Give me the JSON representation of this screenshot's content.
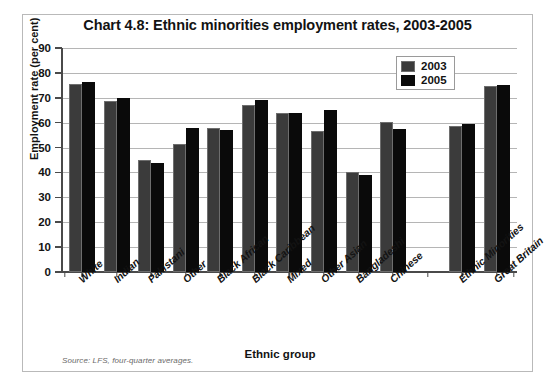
{
  "chart_data": {
    "type": "bar",
    "title": "Chart 4.8: Ethnic minorities employment rates, 2003-2005",
    "xlabel": "Ethnic group",
    "ylabel": "Employment rate (per cent)",
    "ylim": [
      0,
      90
    ],
    "ytick_step": 10,
    "yticks": [
      90,
      80,
      70,
      60,
      50,
      40,
      30,
      20,
      10,
      0
    ],
    "grid": true,
    "legend_position": "top-right",
    "categories": [
      "White",
      "Indian",
      "Pakistani",
      "Other",
      "Black African",
      "Black Caribbean",
      "Mixed",
      "Other Asian",
      "Bangladeshi",
      "Chinese",
      "",
      "Ethnic Minorities",
      "Great Britain"
    ],
    "series": [
      {
        "name": "2003",
        "color": "#3b3b3b",
        "values": [
          75.5,
          68.8,
          45.0,
          51.3,
          58.0,
          67.0,
          64.0,
          56.8,
          40.0,
          60.3,
          null,
          58.5,
          74.7
        ]
      },
      {
        "name": "2005",
        "color": "#0a0a0a",
        "values": [
          76.5,
          70.0,
          44.0,
          58.0,
          57.0,
          69.0,
          64.0,
          65.0,
          39.0,
          57.3,
          null,
          59.5,
          75.0
        ]
      }
    ],
    "source_note": "Source: LFS, four-quarter averages."
  },
  "legend": {
    "items": [
      {
        "label": "2003"
      },
      {
        "label": "2005"
      }
    ]
  }
}
